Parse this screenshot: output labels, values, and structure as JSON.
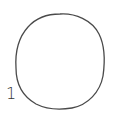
{
  "diagram": {
    "shapes": [
      {
        "type": "circle",
        "label": "1",
        "stroke_color": "#4a4a4a",
        "fill_color": "#ffffff"
      }
    ]
  }
}
